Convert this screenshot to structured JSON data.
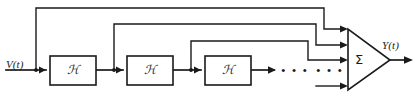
{
  "diagram": {
    "type": "block-diagram",
    "background_color": "#ffffff",
    "line_color": "#1a1a1a",
    "input": {
      "label": "V(t)",
      "name": "input-signal-label"
    },
    "output": {
      "label": "Y(t)",
      "name": "output-signal-label"
    },
    "blocks": [
      {
        "id": "block-0",
        "label": "ℋ",
        "x": 50,
        "y": 56,
        "width": 46,
        "height": 29
      },
      {
        "id": "block-1",
        "label": "ℋ",
        "x": 127,
        "y": 56,
        "width": 46,
        "height": 29
      },
      {
        "id": "block-2",
        "label": "ℋ",
        "x": 205,
        "y": 56,
        "width": 46,
        "height": 29
      }
    ],
    "summer": {
      "label": "Σ",
      "name": "summation-junction",
      "apex_x": 390,
      "left_x": 348,
      "top_y": 29,
      "bottom_y": 90
    },
    "ellipses": [
      {
        "id": "ellipsis-chain",
        "label": "• • •",
        "x": 285,
        "y": 70
      },
      {
        "id": "ellipsis-taps",
        "label": "• • •",
        "x": 320,
        "y": 70
      }
    ],
    "tap_count": 4,
    "feedforward_levels": [
      8,
      24,
      41,
      57
    ]
  }
}
